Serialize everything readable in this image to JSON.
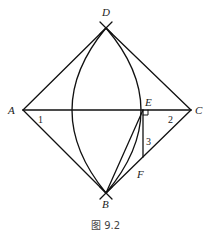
{
  "figure": {
    "caption": "图 9.2",
    "points": {
      "A": {
        "label": "A",
        "x": 23,
        "y": 110
      },
      "B": {
        "label": "B",
        "x": 106,
        "y": 193
      },
      "C": {
        "label": "C",
        "x": 191,
        "y": 110
      },
      "D": {
        "label": "D",
        "x": 106,
        "y": 28
      },
      "E": {
        "label": "E",
        "x": 143,
        "y": 110
      },
      "F": {
        "label": "F",
        "x": 143,
        "y": 157
      }
    },
    "angles": {
      "angle1": "1",
      "angle2": "2",
      "angle3": "3"
    },
    "segments": [
      "AD",
      "DC",
      "AB",
      "BC",
      "AC",
      "EF",
      "BE"
    ],
    "arcs": [
      "arc through D and B (left)",
      "arc through D and B (right, through E)"
    ],
    "right_angle_at": "E"
  }
}
